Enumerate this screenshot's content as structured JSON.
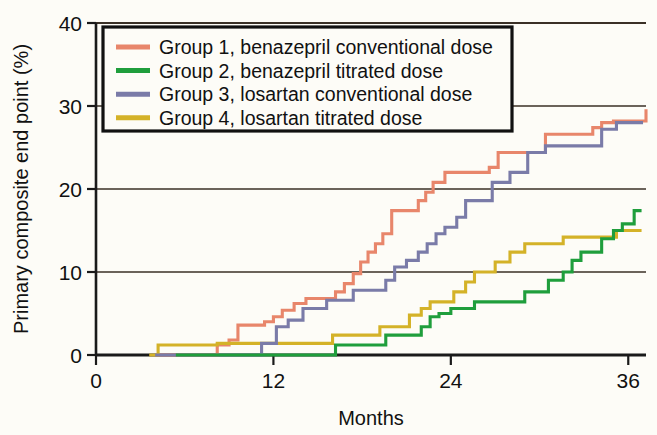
{
  "figure": {
    "background_color": "#fdfcf7",
    "axis_color": "#1a1a1a",
    "grid_color": "#3a3026",
    "text_color": "#111111"
  },
  "axes": {
    "x": {
      "title": "Months",
      "ticks": [
        "0",
        "12",
        "24",
        "36"
      ],
      "tick_values": [
        0,
        12,
        24,
        36
      ],
      "range": [
        0,
        37.2
      ]
    },
    "y": {
      "title": "Primary composite end point (%)",
      "ticks": [
        "0",
        "10",
        "20",
        "30",
        "40"
      ],
      "tick_values": [
        0,
        10,
        20,
        30,
        40
      ],
      "range": [
        0,
        40
      ]
    }
  },
  "legend": {
    "border_color": "#111111",
    "background_color": "#fdfcf7",
    "items": [
      {
        "label": "Group 1, benazepril conventional dose",
        "color": "#e8866b"
      },
      {
        "label": "Group 2, benazepril titrated dose",
        "color": "#1f9e3c"
      },
      {
        "label": "Group 3, losartan conventional dose",
        "color": "#7a7ba8"
      },
      {
        "label": "Group 4, losartan titrated dose",
        "color": "#d4b228"
      }
    ]
  },
  "chart_data": {
    "type": "line",
    "subtype": "step-cumulative-incidence",
    "title": "",
    "xlabel": "Months",
    "ylabel": "Primary composite end point (%)",
    "xlim": [
      0,
      37.2
    ],
    "ylim": [
      0,
      40
    ],
    "grid": true,
    "grid_axis": "y",
    "legend_position": "upper-left-inside",
    "series": [
      {
        "name": "Group 1, benazepril conventional dose",
        "color": "#e8866b",
        "x": [
          4.0,
          5.5,
          7.8,
          8.2,
          9.0,
          9.6,
          10.8,
          11.4,
          12.0,
          12.6,
          13.4,
          14.2,
          15.0,
          15.6,
          16.2,
          16.8,
          17.4,
          17.9,
          18.4,
          18.9,
          19.4,
          20.0,
          20.6,
          21.2,
          21.8,
          22.3,
          22.8,
          23.6,
          26.0,
          26.6,
          27.2,
          27.8,
          28.4,
          30.4,
          31.6,
          33.6,
          34.2,
          35.0,
          36.6,
          37.2
        ],
        "y": [
          0.0,
          0.0,
          0.0,
          1.2,
          1.8,
          3.6,
          3.6,
          4.0,
          4.6,
          5.4,
          6.2,
          6.8,
          6.8,
          6.8,
          7.6,
          8.6,
          9.8,
          11.2,
          12.4,
          13.4,
          14.6,
          17.4,
          17.4,
          17.4,
          18.6,
          19.6,
          20.8,
          22.0,
          22.0,
          22.6,
          24.4,
          24.4,
          24.4,
          26.6,
          26.6,
          27.4,
          28.0,
          28.2,
          28.2,
          29.6
        ]
      },
      {
        "name": "Group 2, benazepril titrated dose",
        "color": "#1f9e3c",
        "x": [
          5.4,
          9.8,
          15.6,
          16.2,
          18.6,
          19.6,
          21.2,
          22.0,
          22.6,
          23.2,
          24.0,
          25.0,
          25.6,
          26.6,
          27.8,
          29.0,
          30.0,
          30.6,
          31.6,
          32.2,
          32.8,
          33.4,
          34.2,
          35.0,
          35.6,
          36.4,
          36.9
        ],
        "y": [
          0.0,
          0.0,
          0.0,
          1.2,
          1.2,
          2.4,
          2.4,
          3.4,
          4.6,
          5.0,
          5.6,
          5.6,
          6.4,
          6.4,
          6.4,
          7.6,
          7.6,
          9.0,
          10.0,
          11.4,
          12.4,
          12.4,
          14.0,
          15.0,
          15.8,
          17.4,
          17.4
        ]
      },
      {
        "name": "Group 3, losartan conventional dose",
        "color": "#7a7ba8",
        "x": [
          4.0,
          10.6,
          11.2,
          12.2,
          13.0,
          14.0,
          15.0,
          15.6,
          16.4,
          17.4,
          18.8,
          19.6,
          20.2,
          21.0,
          21.8,
          22.4,
          23.0,
          23.6,
          24.4,
          25.0,
          25.6,
          26.2,
          26.8,
          28.0,
          29.2,
          30.4,
          33.6,
          34.2,
          35.2,
          37.0
        ],
        "y": [
          0.0,
          0.0,
          1.4,
          3.4,
          4.2,
          5.6,
          5.6,
          6.6,
          6.6,
          7.8,
          7.8,
          9.0,
          10.6,
          11.4,
          12.4,
          13.4,
          14.6,
          15.4,
          16.6,
          18.6,
          18.6,
          18.6,
          20.8,
          22.0,
          24.4,
          25.2,
          25.2,
          27.2,
          28.0,
          28.0
        ]
      },
      {
        "name": "Group 4, losartan titrated dose",
        "color": "#d4b228",
        "x": [
          3.6,
          4.2,
          7.6,
          8.2,
          10.8,
          15.4,
          16.0,
          18.4,
          19.2,
          20.4,
          21.2,
          22.0,
          22.6,
          23.4,
          24.2,
          25.0,
          25.6,
          26.4,
          27.0,
          28.0,
          29.0,
          30.0,
          30.8,
          31.6,
          32.4,
          33.4,
          34.2,
          35.2,
          36.4,
          36.9
        ],
        "y": [
          0.0,
          1.2,
          1.2,
          1.4,
          1.4,
          1.4,
          2.4,
          2.4,
          3.4,
          3.4,
          4.8,
          5.6,
          6.4,
          6.4,
          7.6,
          8.8,
          10.0,
          10.0,
          11.2,
          12.4,
          13.4,
          13.4,
          13.4,
          14.2,
          14.2,
          14.2,
          14.2,
          15.0,
          15.0,
          15.0
        ]
      }
    ]
  }
}
